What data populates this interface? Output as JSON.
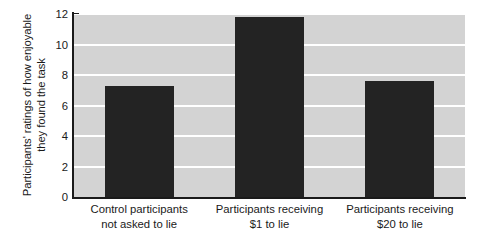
{
  "chart_data": {
    "type": "bar",
    "title": "",
    "xlabel": "",
    "ylabel": "Participants' ratings of how enjoyable they found the task",
    "ylabel_lines": [
      "Participants' ratings of how enjoyable",
      "they found the task"
    ],
    "categories": [
      "Control participants not asked to lie",
      "Participants receiving $1 to lie",
      "Participants receiving $20 to lie"
    ],
    "category_lines": [
      [
        "Control participants",
        "not asked to lie"
      ],
      [
        "Participants receiving",
        "$1 to lie"
      ],
      [
        "Participants receiving",
        "$20 to lie"
      ]
    ],
    "values": [
      7.3,
      11.8,
      7.6
    ],
    "ylim": [
      0,
      12
    ],
    "yticks": [
      0,
      2,
      4,
      6,
      8,
      10,
      12
    ],
    "ytick_labels": [
      "0",
      "2",
      "4",
      "6",
      "8",
      "10",
      "12"
    ],
    "grid": true,
    "grid_color": "#ffffff",
    "plot_background": "#d3d3d3",
    "bar_color": "#232323",
    "axis_color": "#1a1a1a",
    "legend": null
  }
}
